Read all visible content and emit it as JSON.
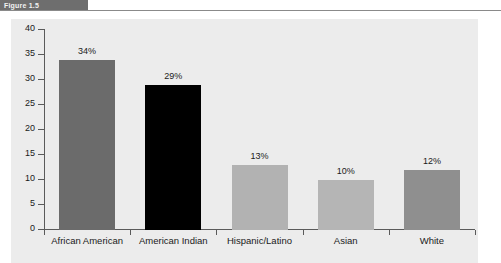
{
  "caption": {
    "tab_label": "Figure 1.5",
    "title": "",
    "rule_color": "#8a8a8a",
    "tab_color": "#6e6e6e"
  },
  "chart_data": {
    "type": "bar",
    "title": "",
    "xlabel": "",
    "ylabel": "",
    "ylim": [
      0,
      40
    ],
    "ytick_step": 5,
    "grid": false,
    "legend": "none",
    "categories": [
      "African American",
      "American Indian",
      "Hispanic/Latino",
      "Asian",
      "White"
    ],
    "values": [
      34,
      29,
      13,
      10,
      12
    ],
    "data_labels": [
      "34%",
      "29%",
      "13%",
      "10%",
      "12%"
    ],
    "ytick_labels": [
      "0",
      "5",
      "10",
      "15",
      "20",
      "25",
      "30",
      "35",
      "40"
    ],
    "bar_colors": [
      "#6b6b6b",
      "#000000",
      "#b2b2b2",
      "#b5b5b5",
      "#8f8f8f"
    ],
    "plot_background": "#ececec",
    "axis_color": "#5a5a5a"
  }
}
